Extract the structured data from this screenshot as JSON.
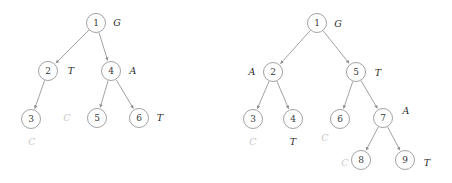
{
  "figure": {
    "background_color": "#ffffff",
    "node_stroke_color": "#8a8a8a",
    "edge_color": "#8a8a8a",
    "label_color": "#2b2b2b",
    "muted_label_color": "#c9c9c9"
  },
  "trees": [
    {
      "id": "left-tree",
      "name": "left-tree",
      "nodes": [
        {
          "id": "L1",
          "label": "1",
          "x": 96,
          "y": 23,
          "r": 9.5
        },
        {
          "id": "L2",
          "label": "2",
          "x": 48,
          "y": 71,
          "r": 9.5
        },
        {
          "id": "L4",
          "label": "4",
          "x": 111,
          "y": 71,
          "r": 9.5
        },
        {
          "id": "L3",
          "label": "3",
          "x": 31,
          "y": 119,
          "r": 9.5
        },
        {
          "id": "L5",
          "label": "5",
          "x": 97,
          "y": 118,
          "r": 9.5
        },
        {
          "id": "L6",
          "label": "6",
          "x": 139,
          "y": 118,
          "r": 9.5
        }
      ],
      "edges": [
        {
          "from": "L1",
          "to": "L2"
        },
        {
          "from": "L1",
          "to": "L4"
        },
        {
          "from": "L2",
          "to": "L3"
        },
        {
          "from": "L4",
          "to": "L5"
        },
        {
          "from": "L4",
          "to": "L6"
        }
      ],
      "labels": [
        {
          "id": "L-lbl-G",
          "text": "G",
          "x": 117,
          "y": 22,
          "muted": false,
          "for_node": "L1"
        },
        {
          "id": "L-lbl-T",
          "text": "T",
          "x": 71,
          "y": 70,
          "muted": false,
          "for_node": "L2"
        },
        {
          "id": "L-lbl-A",
          "text": "A",
          "x": 133,
          "y": 70,
          "muted": false,
          "for_node": "L4"
        },
        {
          "id": "L-lbl-C1",
          "text": "C",
          "x": 32,
          "y": 141,
          "muted": true,
          "for_node": "L3"
        },
        {
          "id": "L-lbl-C2",
          "text": "C",
          "x": 67,
          "y": 117,
          "muted": true,
          "for_node": "L5"
        },
        {
          "id": "L-lbl-T2",
          "text": "T",
          "x": 160,
          "y": 117,
          "muted": false,
          "for_node": "L6"
        }
      ]
    },
    {
      "id": "right-tree",
      "name": "right-tree",
      "nodes": [
        {
          "id": "R1",
          "label": "1",
          "x": 91,
          "y": 23,
          "r": 9.5
        },
        {
          "id": "R2",
          "label": "2",
          "x": 47,
          "y": 72,
          "r": 9.5
        },
        {
          "id": "R5",
          "label": "5",
          "x": 130,
          "y": 72,
          "r": 9.5
        },
        {
          "id": "R3",
          "label": "3",
          "x": 27,
          "y": 119,
          "r": 9.5
        },
        {
          "id": "R4",
          "label": "4",
          "x": 67,
          "y": 119,
          "r": 9.5
        },
        {
          "id": "R6",
          "label": "6",
          "x": 114,
          "y": 119,
          "r": 9.5
        },
        {
          "id": "R7",
          "label": "7",
          "x": 157,
          "y": 118,
          "r": 9.5
        },
        {
          "id": "R8",
          "label": "8",
          "x": 135,
          "y": 160,
          "r": 9.5
        },
        {
          "id": "R9",
          "label": "9",
          "x": 179,
          "y": 160,
          "r": 9.5
        }
      ],
      "edges": [
        {
          "from": "R1",
          "to": "R2"
        },
        {
          "from": "R1",
          "to": "R5"
        },
        {
          "from": "R2",
          "to": "R3"
        },
        {
          "from": "R2",
          "to": "R4"
        },
        {
          "from": "R5",
          "to": "R6"
        },
        {
          "from": "R5",
          "to": "R7"
        },
        {
          "from": "R7",
          "to": "R8"
        },
        {
          "from": "R7",
          "to": "R9"
        }
      ],
      "labels": [
        {
          "id": "R-lbl-G",
          "text": "G",
          "x": 112,
          "y": 23,
          "muted": false,
          "for_node": "R1"
        },
        {
          "id": "R-lbl-A1",
          "text": "A",
          "x": 26,
          "y": 71,
          "muted": false,
          "for_node": "R2"
        },
        {
          "id": "R-lbl-T1",
          "text": "T",
          "x": 152,
          "y": 72,
          "muted": false,
          "for_node": "R5"
        },
        {
          "id": "R-lbl-C1",
          "text": "C",
          "x": 27,
          "y": 141,
          "muted": true,
          "for_node": "R3"
        },
        {
          "id": "R-lbl-T2",
          "text": "T",
          "x": 67,
          "y": 141,
          "muted": false,
          "for_node": "R4"
        },
        {
          "id": "R-lbl-C2",
          "text": "C",
          "x": 99,
          "y": 137,
          "muted": true,
          "for_node": "R6"
        },
        {
          "id": "R-lbl-A2",
          "text": "A",
          "x": 180,
          "y": 110,
          "muted": false,
          "for_node": "R7"
        },
        {
          "id": "R-lbl-C3",
          "text": "C",
          "x": 119,
          "y": 162,
          "muted": true,
          "for_node": "R8"
        },
        {
          "id": "R-lbl-T3",
          "text": "T",
          "x": 201,
          "y": 162,
          "muted": false,
          "for_node": "R9"
        }
      ]
    }
  ]
}
